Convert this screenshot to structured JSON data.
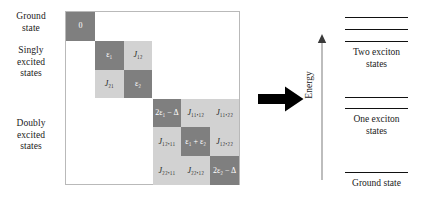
{
  "figure": {
    "left_panel": {
      "row_group_labels": [
        {
          "id": "ground",
          "text": "Ground\nstate"
        },
        {
          "id": "singly",
          "text": "Singly\nexcited\nstates"
        },
        {
          "id": "doubly",
          "text": "Doubly\nexcited\nstates"
        }
      ],
      "matrix": {
        "size": 6,
        "blocks": [
          {
            "name": "ground-block",
            "rows": 1,
            "cols": 1
          },
          {
            "name": "singly-excited-block",
            "rows": 2,
            "cols": 2
          },
          {
            "name": "doubly-excited-block",
            "rows": 3,
            "cols": 3
          }
        ],
        "cells": [
          {
            "row": 0,
            "col": 0,
            "shade": "dark",
            "label": "0",
            "diagonal": true
          },
          {
            "row": 1,
            "col": 1,
            "shade": "dark",
            "label": "ε₁",
            "diagonal": true
          },
          {
            "row": 1,
            "col": 2,
            "shade": "light",
            "label": "J₁₂",
            "diagonal": false
          },
          {
            "row": 2,
            "col": 1,
            "shade": "light",
            "label": "J₂₁",
            "diagonal": false
          },
          {
            "row": 2,
            "col": 2,
            "shade": "dark",
            "label": "ε₂",
            "diagonal": true
          },
          {
            "row": 3,
            "col": 3,
            "shade": "dark",
            "label": "2ε₁ − Δ",
            "diagonal": true
          },
          {
            "row": 3,
            "col": 4,
            "shade": "light",
            "label": "J₁₁,₁₂",
            "diagonal": false
          },
          {
            "row": 3,
            "col": 5,
            "shade": "light",
            "label": "J₁₁,₂₂",
            "diagonal": false
          },
          {
            "row": 4,
            "col": 3,
            "shade": "light",
            "label": "J₁₂,₁₁",
            "diagonal": false
          },
          {
            "row": 4,
            "col": 4,
            "shade": "dark",
            "label": "ε₁ + ε₂",
            "diagonal": true
          },
          {
            "row": 4,
            "col": 5,
            "shade": "light",
            "label": "J₁₂,₂₂",
            "diagonal": false
          },
          {
            "row": 5,
            "col": 3,
            "shade": "light",
            "label": "J₂₂,₁₁",
            "diagonal": false
          },
          {
            "row": 5,
            "col": 4,
            "shade": "light",
            "label": "J₂₂,₁₂",
            "diagonal": false
          },
          {
            "row": 5,
            "col": 5,
            "shade": "dark",
            "label": "2ε₂ − Δ",
            "diagonal": true
          }
        ]
      }
    },
    "transition_arrow": {
      "direction": "right",
      "color": "#000000"
    },
    "right_panel": {
      "axis_label": "Energy",
      "axis_direction": "up",
      "groups": [
        {
          "id": "two-exciton",
          "label": "Two exciton\nstates",
          "level_count": 3
        },
        {
          "id": "one-exciton",
          "label": "One exciton\nstates",
          "level_count": 2
        },
        {
          "id": "ground-state",
          "label": "Ground state",
          "level_count": 1
        }
      ]
    },
    "colors": {
      "cell_diagonal": "#7f7f7f",
      "cell_offdiagonal": "#d2d2d2",
      "matrix_border": "#b9b9b9",
      "level_line": "#111111",
      "text": "#1a1a1a",
      "background": "#ffffff"
    }
  }
}
